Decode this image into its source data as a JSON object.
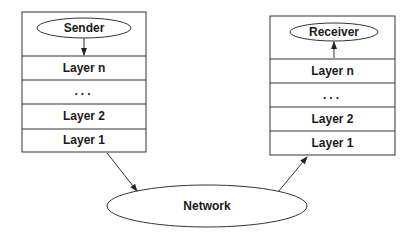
{
  "sender_stack": {
    "top_label": "Sender",
    "layers": [
      "Layer n",
      "...",
      "Layer 2",
      "Layer 1"
    ]
  },
  "receiver_stack": {
    "top_label": "Receiver",
    "layers": [
      "Layer n",
      "...",
      "Layer 2",
      "Layer 1"
    ]
  },
  "network": {
    "label": "Network"
  },
  "colors": {
    "stroke": "#333333",
    "text": "#1a1a1a",
    "background": "#ffffff"
  }
}
